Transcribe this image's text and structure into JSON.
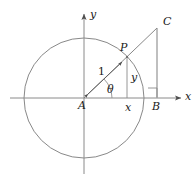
{
  "figure": {
    "type": "geometry-diagram",
    "stroke_color": "#6b6b6b",
    "text_color": "#1a1a1a",
    "background": "#ffffff",
    "width": 196,
    "height": 183
  },
  "geometry": {
    "origin": {
      "x": 84,
      "y": 98
    },
    "circle": {
      "cx": 84,
      "cy": 98,
      "r": 60
    },
    "points": {
      "A": {
        "x": 84,
        "y": 98
      },
      "P": {
        "x": 127,
        "y": 57
      },
      "B": {
        "x": 157,
        "y": 98
      },
      "C": {
        "x": 157,
        "y": 28
      }
    },
    "x_axis": {
      "x1": 10,
      "y1": 98,
      "x2": 183,
      "y2": 98
    },
    "y_axis": {
      "x1": 84,
      "y1": 172,
      "x2": 84,
      "y2": 12
    }
  },
  "labels": {
    "axis_y": {
      "text": "y",
      "x": 90,
      "y": 9
    },
    "axis_x": {
      "text": "x",
      "x": 185,
      "y": 91
    },
    "point_C": {
      "text": "C",
      "x": 163,
      "y": 16
    },
    "point_P": {
      "text": "P",
      "x": 120,
      "y": 42
    },
    "radius_one": {
      "text": "1",
      "x": 98,
      "y": 66
    },
    "angle_theta": {
      "text": "θ",
      "x": 107,
      "y": 84
    },
    "side_y": {
      "text": "y",
      "x": 131,
      "y": 72
    },
    "point_A": {
      "text": "A",
      "x": 78,
      "y": 100
    },
    "side_x": {
      "text": "x",
      "x": 125,
      "y": 102
    },
    "point_B": {
      "text": "B",
      "x": 152,
      "y": 101
    }
  }
}
